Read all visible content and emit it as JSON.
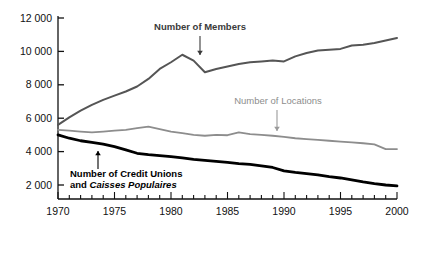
{
  "chart_data": {
    "type": "line",
    "title": "",
    "xlabel": "",
    "ylabel": "",
    "xlim": [
      1970,
      2000
    ],
    "ylim": [
      0,
      12000
    ],
    "grid": false,
    "legend_position": "inline-annotations",
    "y_ticks": [
      2000,
      4000,
      6000,
      8000,
      10000,
      12000
    ],
    "y_tick_labels": [
      "2 000",
      "4 000",
      "6 000",
      "8 000",
      "10 000",
      "12 000"
    ],
    "x_ticks": [
      1970,
      1975,
      1980,
      1985,
      1990,
      1995,
      2000
    ],
    "x_tick_labels": [
      "1970",
      "1975",
      "1980",
      "1985",
      "1990",
      "1995",
      "2000"
    ],
    "x_minor_tick_step": 1,
    "x": [
      1970,
      1971,
      1972,
      1973,
      1974,
      1975,
      1976,
      1977,
      1978,
      1979,
      1980,
      1981,
      1982,
      1983,
      1984,
      1985,
      1986,
      1987,
      1988,
      1989,
      1990,
      1991,
      1992,
      1993,
      1994,
      1995,
      1996,
      1997,
      1998,
      1999,
      2000
    ],
    "series": [
      {
        "name": "Number of Members",
        "color": "#555555",
        "width": 2.0,
        "values": [
          5600,
          6050,
          6450,
          6800,
          7100,
          7350,
          7600,
          7900,
          8350,
          8950,
          9350,
          9800,
          9450,
          8750,
          8950,
          9100,
          9250,
          9350,
          9400,
          9450,
          9400,
          9700,
          9900,
          10050,
          10100,
          10150,
          10350,
          10400,
          10500,
          10650,
          10800
        ]
      },
      {
        "name": "Number of Locations",
        "color": "#8d8d8d",
        "width": 1.8,
        "values": [
          5300,
          5250,
          5200,
          5150,
          5200,
          5250,
          5300,
          5400,
          5500,
          5350,
          5200,
          5100,
          5000,
          4950,
          5000,
          4980,
          5150,
          5050,
          5000,
          4950,
          4880,
          4800,
          4750,
          4700,
          4650,
          4600,
          4550,
          4500,
          4430,
          4150,
          4150
        ]
      },
      {
        "name": "Number of Credit Unions and Caisses Populaires",
        "color": "#000000",
        "width": 2.8,
        "values": [
          5000,
          4800,
          4650,
          4550,
          4450,
          4300,
          4100,
          3900,
          3820,
          3760,
          3700,
          3620,
          3540,
          3480,
          3420,
          3350,
          3280,
          3230,
          3150,
          3050,
          2850,
          2750,
          2680,
          2600,
          2500,
          2420,
          2300,
          2180,
          2080,
          2000,
          1950
        ]
      }
    ],
    "annotations": [
      {
        "id": "members-label",
        "text": "Number of Members",
        "style": "bold-darkgray",
        "label_x": 200,
        "label_y": 30,
        "arrow_from_x": 200,
        "arrow_from_y": 36,
        "arrow_to_x": 200,
        "arrow_to_y": 55,
        "arrow_direction": "down"
      },
      {
        "id": "locations-label",
        "text": "Number of Locations",
        "style": "plain-gray",
        "label_x": 278,
        "label_y": 104,
        "arrow_from_x": 277,
        "arrow_from_y": 110,
        "arrow_to_x": 277,
        "arrow_to_y": 131,
        "arrow_direction": "down"
      },
      {
        "id": "credit-unions-label",
        "line1": "Number of Credit Unions",
        "line2_prefix": "and ",
        "line2_italic": "Caisses Populaires",
        "style": "bold-black",
        "label_x": 70,
        "label_y1": 177,
        "label_y2": 188,
        "arrow_from_x": 98,
        "arrow_from_y": 169,
        "arrow_to_x": 98,
        "arrow_to_y": 151,
        "arrow_direction": "up"
      }
    ]
  },
  "colors": {
    "axis": "#111111",
    "members": "#555555",
    "locations": "#8d8d8d",
    "credit_unions": "#000000",
    "background": "#ffffff"
  },
  "geometry": {
    "plot_left": 58,
    "plot_right": 397,
    "plot_top": 18,
    "plot_bottom": 199,
    "y_value_top": 12000,
    "y_pixel_top": 18,
    "y_value_bottom": 2000,
    "y_pixel_bottom": 185
  }
}
